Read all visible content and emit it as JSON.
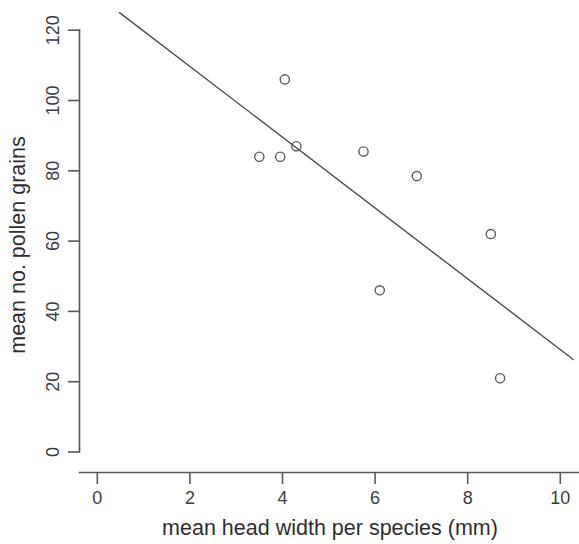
{
  "chart_data": {
    "type": "scatter",
    "title": "",
    "xlabel": "mean head width per species (mm)",
    "ylabel": "mean no. pollen grains",
    "xlim": [
      -0.3,
      10.4
    ],
    "ylim": [
      -5,
      127
    ],
    "xticks": [
      0,
      2,
      4,
      6,
      8,
      10
    ],
    "xtick_labels": [
      "0",
      "2",
      "4",
      "6",
      "8",
      "10"
    ],
    "yticks": [
      0,
      20,
      40,
      60,
      80,
      100,
      120
    ],
    "ytick_labels": [
      "0",
      "20",
      "40",
      "60",
      "80",
      "100",
      "120"
    ],
    "grid": false,
    "legend": null,
    "marker": "open-circle",
    "points": [
      {
        "x": 3.5,
        "y": 84.0
      },
      {
        "x": 3.95,
        "y": 84.0
      },
      {
        "x": 4.3,
        "y": 87.0
      },
      {
        "x": 4.05,
        "y": 106.0
      },
      {
        "x": 5.75,
        "y": 85.5
      },
      {
        "x": 6.9,
        "y": 78.5
      },
      {
        "x": 6.1,
        "y": 46.0
      },
      {
        "x": 8.5,
        "y": 62.0
      },
      {
        "x": 8.7,
        "y": 21.0
      }
    ],
    "fit_line": {
      "type": "linear-regression",
      "x_start": 0.48,
      "y_start": 125.0,
      "x_end": 10.28,
      "y_end": 26.3
    },
    "colors": {
      "axis": "#58585a",
      "point_stroke": "#5a5a5c",
      "line": "#4a4a4c",
      "text": "#2e2e30",
      "background": "#ffffff"
    }
  }
}
